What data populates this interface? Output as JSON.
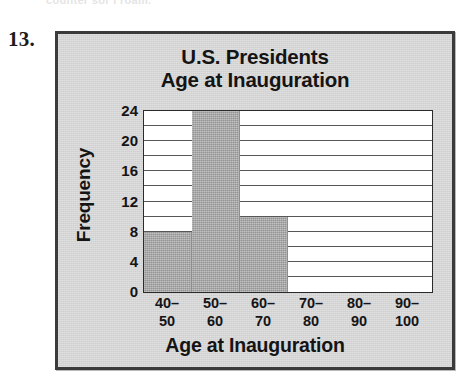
{
  "page": {
    "item_number": "13.",
    "cut_off_text_above": "counter sor i roam."
  },
  "chart_data": {
    "type": "bar",
    "title": "U.S. Presidents Age at Inauguration",
    "title_lines": [
      "U.S. Presidents",
      "Age at Inauguration"
    ],
    "xlabel": "Age at Inauguration",
    "ylabel": "Frequency",
    "categories": [
      "40–50",
      "50–60",
      "60–70",
      "70–80",
      "80–90",
      "90–100"
    ],
    "category_lines": [
      [
        "40–",
        "50"
      ],
      [
        "50–",
        "60"
      ],
      [
        "60–",
        "70"
      ],
      [
        "70–",
        "80"
      ],
      [
        "80–",
        "90"
      ],
      [
        "90–",
        "100"
      ]
    ],
    "values": [
      8,
      24,
      10,
      0,
      0,
      0
    ],
    "ylim": [
      0,
      24
    ],
    "ytick_labels": [
      "0",
      "4",
      "8",
      "12",
      "16",
      "20",
      "24"
    ],
    "ytick_values": [
      0,
      4,
      8,
      12,
      16,
      20,
      24
    ],
    "gridline_values": [
      2,
      4,
      6,
      8,
      10,
      12,
      14,
      16,
      18,
      20,
      22
    ],
    "grid": true,
    "legend": "none",
    "colors": {
      "bar_fill": "#a9a9a9",
      "panel_background": "#d6d6d6",
      "panel_border": "#3b3b3b",
      "plot_background": "#ffffff",
      "axis_line": "#2b2b2b",
      "text": "#141414"
    }
  }
}
